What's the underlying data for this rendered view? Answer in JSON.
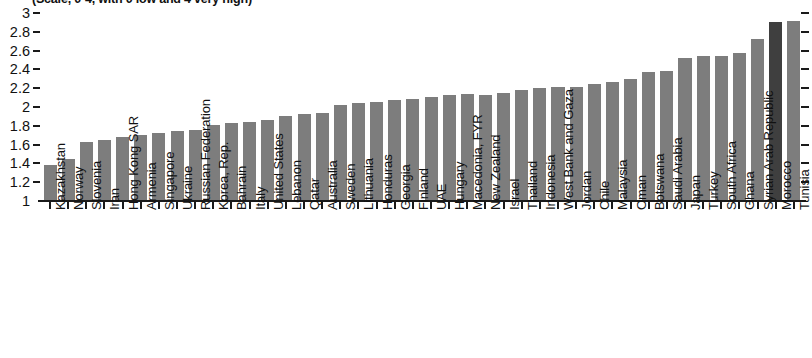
{
  "chart_data": {
    "type": "bar",
    "title": "(Scale, 0-4, with 0 low and 4 very high)",
    "xlabel": "",
    "ylabel": "",
    "ylim": [
      1,
      3
    ],
    "grid": false,
    "legend": "none",
    "ytick_labels": [
      "3",
      "2.8",
      "2.6",
      "2.4",
      "2.2",
      "2",
      "1.8",
      "1.6",
      "1.4",
      "1.2",
      "1"
    ],
    "ytick_values": [
      3,
      2.8,
      2.6,
      2.4,
      2.2,
      2,
      1.8,
      1.6,
      1.4,
      1.2,
      1
    ],
    "highlight_category": "Morocco",
    "bar_color": "#7d7d7d",
    "highlight_color": "#3f3f3f",
    "axis_color": "#1a1a1a",
    "categories": [
      "Kazakhstan",
      "Norway",
      "Slovenia",
      "Iran",
      "Hong Kong SAR",
      "Armenia",
      "Singapore",
      "Ukraine",
      "Russian Federation",
      "Korea, Rep.",
      "Bahrain",
      "Italy",
      "United States",
      "Lebanon",
      "Qatar",
      "Australia",
      "Sweden",
      "Lithuania",
      "Honduras",
      "Georgia",
      "Finland",
      "UAE",
      "Hungary",
      "Macedonia, FYR",
      "New Zealand",
      "Israel",
      "Thailand",
      "Indonesia",
      "West Bank and Gaza",
      "Jordan",
      "Chile",
      "Malaysia",
      "Oman",
      "Botswana",
      "Saudi Arabia",
      "Japan",
      "Turkey",
      "South Africa",
      "Ghana",
      "Syrian Arab Republic",
      "Morocco",
      "Tunisia"
    ],
    "values": [
      1.38,
      1.45,
      1.63,
      1.65,
      1.68,
      1.7,
      1.72,
      1.74,
      1.76,
      1.81,
      1.83,
      1.84,
      1.86,
      1.9,
      1.93,
      1.94,
      2.02,
      2.04,
      2.05,
      2.07,
      2.09,
      2.11,
      2.13,
      2.14,
      2.13,
      2.15,
      2.18,
      2.2,
      2.21,
      2.21,
      2.24,
      2.27,
      2.3,
      2.37,
      2.38,
      2.52,
      2.54,
      2.54,
      2.57,
      2.72,
      2.9,
      2.91
    ]
  }
}
